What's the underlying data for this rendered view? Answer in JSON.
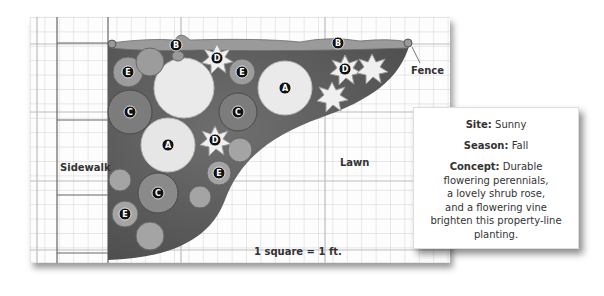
{
  "labels": {
    "sidewalk": "Sidewalk",
    "lawn": "Lawn",
    "fence": "Fence",
    "scale": "1 square = 1 ft."
  },
  "plants": [
    {
      "key": "B",
      "x": 176,
      "y": 45
    },
    {
      "key": "B",
      "x": 338,
      "y": 43
    },
    {
      "key": "D",
      "x": 217,
      "y": 58
    },
    {
      "key": "D",
      "x": 345,
      "y": 69
    },
    {
      "key": "E",
      "x": 128,
      "y": 72
    },
    {
      "key": "E",
      "x": 242,
      "y": 72
    },
    {
      "key": "A",
      "x": 285,
      "y": 88
    },
    {
      "key": "C",
      "x": 130,
      "y": 112
    },
    {
      "key": "C",
      "x": 238,
      "y": 112
    },
    {
      "key": "D",
      "x": 215,
      "y": 140
    },
    {
      "key": "A",
      "x": 168,
      "y": 145
    },
    {
      "key": "E",
      "x": 219,
      "y": 173
    },
    {
      "key": "C",
      "x": 158,
      "y": 193
    },
    {
      "key": "E",
      "x": 125,
      "y": 214
    }
  ],
  "card": {
    "site_label": "Site:",
    "site_value": "Sunny",
    "season_label": "Season:",
    "season_value": "Fall",
    "concept_label": "Concept:",
    "concept_lines": [
      "Durable",
      "flowering perennials,",
      "a lovely shrub rose,",
      "and a flowering vine",
      "brighten this property-line",
      "planting."
    ]
  }
}
